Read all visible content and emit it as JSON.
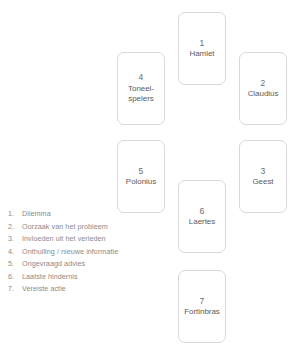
{
  "diagram": {
    "type": "card-spread",
    "cards": [
      {
        "number": "1",
        "label": "Hamlet"
      },
      {
        "number": "2",
        "label": "Claudius"
      },
      {
        "number": "3",
        "label": "Geest"
      },
      {
        "number": "4",
        "label": "Toneel-spelers"
      },
      {
        "number": "5",
        "label": "Polonius"
      },
      {
        "number": "6",
        "label": "Laertes"
      },
      {
        "number": "7",
        "label": "Fortinbras"
      }
    ]
  },
  "legend": {
    "items": [
      {
        "number": "1.",
        "text": "Dilemma"
      },
      {
        "number": "2.",
        "text": "Oorzaak van het probleem"
      },
      {
        "number": "3.",
        "text": "Invloeden uit het verleden"
      },
      {
        "number": "4.",
        "text": "Onthulling / nieuwe informatie"
      },
      {
        "number": "5.",
        "text": "Ongevraagd advies"
      },
      {
        "number": "6.",
        "text": "Laatste hindernis"
      },
      {
        "number": "7.",
        "text": "Vereiste actie"
      }
    ]
  },
  "colors": {
    "background": "#ffffff",
    "card_border": "#d8d8d8",
    "card_text": "#5c5c5c",
    "legend_text": "#8a8a8a"
  }
}
